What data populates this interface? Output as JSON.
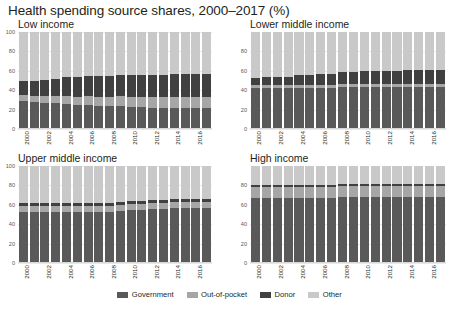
{
  "title": "Health spending source shares, 2000–2017 (%)",
  "legend": {
    "position": "bottom-center",
    "items": [
      {
        "label": "Government",
        "color": "#595959"
      },
      {
        "label": "Out-of-pocket",
        "color": "#a6a6a6"
      },
      {
        "label": "Donor",
        "color": "#404040"
      },
      {
        "label": "Other",
        "color": "#c9c9c9"
      }
    ]
  },
  "chart_data": {
    "type": "bar",
    "stacked": true,
    "title": "Health spending source shares, 2000–2017 (%)",
    "xlabel": "",
    "ylabel": "",
    "ylim": [
      0,
      100
    ],
    "grid": true,
    "x": [
      2000,
      2001,
      2002,
      2003,
      2004,
      2005,
      2006,
      2007,
      2008,
      2009,
      2010,
      2011,
      2012,
      2013,
      2014,
      2015,
      2016,
      2017
    ],
    "tick_labels_shown": [
      "2000",
      "2002",
      "2004",
      "2006",
      "2008",
      "2010",
      "2012",
      "2014",
      "2016"
    ],
    "series_names": [
      "Government",
      "Out-of-pocket",
      "Donor",
      "Other"
    ],
    "panels": [
      {
        "name": "Low income",
        "yticks": [
          0,
          20,
          40,
          60,
          80,
          100
        ],
        "series": [
          {
            "name": "Government",
            "values": [
              29,
              28,
              27,
              27,
              26,
              25,
              25,
              24,
              24,
              24,
              23,
              23,
              22,
              22,
              22,
              22,
              22,
              22
            ]
          },
          {
            "name": "Out-of-pocket",
            "values": [
              6,
              6,
              7,
              7,
              8,
              8,
              9,
              9,
              9,
              10,
              10,
              10,
              11,
              11,
              11,
              11,
              11,
              11
            ]
          },
          {
            "name": "Donor",
            "values": [
              15,
              16,
              17,
              18,
              20,
              21,
              21,
              22,
              22,
              22,
              23,
              23,
              23,
              23,
              24,
              24,
              24,
              24
            ]
          },
          {
            "name": "Other",
            "values": [
              50,
              50,
              49,
              48,
              46,
              46,
              45,
              45,
              45,
              44,
              44,
              44,
              44,
              44,
              43,
              43,
              43,
              43
            ]
          }
        ]
      },
      {
        "name": "Lower middle income",
        "yticks": [
          0,
          20,
          40,
          60,
          80
        ],
        "series": [
          {
            "name": "Government",
            "values": [
              42,
              42,
              42,
              42,
              42,
              42,
              42,
              42,
              43,
              43,
              43,
              43,
              43,
              43,
              43,
              43,
              43,
              43
            ]
          },
          {
            "name": "Out-of-pocket",
            "values": [
              3,
              3,
              3,
              3,
              3,
              3,
              3,
              3,
              3,
              3,
              3,
              3,
              3,
              3,
              3,
              3,
              3,
              3
            ]
          },
          {
            "name": "Donor",
            "values": [
              8,
              9,
              9,
              9,
              11,
              11,
              12,
              12,
              13,
              13,
              14,
              14,
              14,
              14,
              15,
              15,
              15,
              15
            ]
          },
          {
            "name": "Other",
            "values": [
              47,
              46,
              46,
              46,
              44,
              44,
              43,
              43,
              41,
              41,
              40,
              40,
              40,
              40,
              39,
              39,
              39,
              39
            ]
          }
        ]
      },
      {
        "name": "Upper middle income",
        "yticks": [
          0,
          20,
          40,
          60,
          80,
          100
        ],
        "series": [
          {
            "name": "Government",
            "values": [
              53,
              53,
              53,
              53,
              53,
              53,
              53,
              53,
              53,
              54,
              55,
              55,
              56,
              56,
              57,
              57,
              57,
              57
            ]
          },
          {
            "name": "Out-of-pocket",
            "values": [
              6,
              6,
              6,
              6,
              6,
              6,
              6,
              6,
              6,
              6,
              6,
              6,
              6,
              6,
              6,
              6,
              6,
              6
            ]
          },
          {
            "name": "Donor",
            "values": [
              3,
              3,
              3,
              3,
              3,
              3,
              3,
              3,
              3,
              3,
              3,
              3,
              3,
              3,
              3,
              3,
              3,
              3
            ]
          },
          {
            "name": "Other",
            "values": [
              38,
              38,
              38,
              38,
              38,
              38,
              38,
              38,
              38,
              37,
              36,
              36,
              35,
              35,
              34,
              34,
              34,
              34
            ]
          }
        ]
      },
      {
        "name": "High income",
        "yticks": [
          0,
          20,
          40,
          60,
          80
        ],
        "series": [
          {
            "name": "Government",
            "values": [
              67,
              67,
              67,
              67,
              67,
              67,
              67,
              67,
              68,
              68,
              68,
              68,
              68,
              68,
              68,
              68,
              68,
              68
            ]
          },
          {
            "name": "Out-of-pocket",
            "values": [
              11,
              11,
              11,
              11,
              11,
              11,
              11,
              11,
              11,
              11,
              11,
              11,
              11,
              11,
              11,
              11,
              11,
              11
            ]
          },
          {
            "name": "Donor",
            "values": [
              2,
              2,
              2,
              2,
              2,
              2,
              2,
              2,
              2,
              2,
              2,
              2,
              2,
              2,
              2,
              2,
              2,
              2
            ]
          },
          {
            "name": "Other",
            "values": [
              20,
              20,
              20,
              20,
              20,
              20,
              20,
              20,
              19,
              19,
              19,
              19,
              19,
              19,
              19,
              19,
              19,
              19
            ]
          }
        ]
      }
    ]
  }
}
